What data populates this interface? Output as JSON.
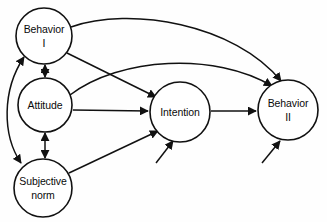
{
  "diagram": {
    "type": "path-diagram",
    "stroke_color": "#111111",
    "node_fill": "#ffffff",
    "background": "#ffffff",
    "nodes": [
      {
        "id": "behavior1",
        "line1": "Behavior",
        "line2": "I",
        "cx": 44,
        "cy": 36,
        "r": 28
      },
      {
        "id": "attitude",
        "line1": "Attitude",
        "line2": "",
        "cx": 45,
        "cy": 105,
        "r": 27
      },
      {
        "id": "subjective",
        "line1": "Subjective",
        "line2": "norm",
        "cx": 43,
        "cy": 188,
        "r": 29
      },
      {
        "id": "intention",
        "line1": "Intention",
        "line2": "",
        "cx": 180,
        "cy": 112,
        "r": 30
      },
      {
        "id": "behavior2",
        "line1": "Behavior",
        "line2": "II",
        "cx": 288,
        "cy": 110,
        "r": 30
      }
    ],
    "edges": [
      {
        "id": "behavior1-to-behavior2",
        "from": "behavior1",
        "to": "behavior2",
        "style": "curved",
        "arrows": "single"
      },
      {
        "id": "behavior1-to-intention",
        "from": "behavior1",
        "to": "intention",
        "style": "straight",
        "arrows": "single"
      },
      {
        "id": "attitude-to-behavior2",
        "from": "attitude",
        "to": "behavior2",
        "style": "curved",
        "arrows": "single"
      },
      {
        "id": "attitude-to-intention",
        "from": "attitude",
        "to": "intention",
        "style": "straight",
        "arrows": "single"
      },
      {
        "id": "subjective-to-intention",
        "from": "subjective",
        "to": "intention",
        "style": "straight",
        "arrows": "single"
      },
      {
        "id": "intention-to-behavior2",
        "from": "intention",
        "to": "behavior2",
        "style": "straight",
        "arrows": "single"
      },
      {
        "id": "behavior1-attitude",
        "from": "behavior1",
        "to": "attitude",
        "style": "vertical",
        "arrows": "double"
      },
      {
        "id": "attitude-subjective",
        "from": "attitude",
        "to": "subjective",
        "style": "vertical",
        "arrows": "double"
      },
      {
        "id": "behavior1-subjective",
        "from": "behavior1",
        "to": "subjective",
        "style": "curved-left",
        "arrows": "double"
      },
      {
        "id": "external-to-intention",
        "from": "external",
        "to": "intention",
        "style": "stub",
        "arrows": "single"
      },
      {
        "id": "external-to-behavior2",
        "from": "external",
        "to": "behavior2",
        "style": "stub",
        "arrows": "single"
      }
    ]
  }
}
